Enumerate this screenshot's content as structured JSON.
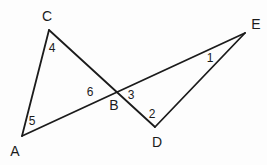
{
  "figure": {
    "background_color": "#fdfdfd",
    "line_color": "#1b1b1b",
    "width": 267,
    "height": 165
  },
  "chart_data": {
    "type": "diagram",
    "points": [
      {
        "name": "A",
        "x": 22,
        "y": 136
      },
      {
        "name": "B",
        "x": 116,
        "y": 91
      },
      {
        "name": "C",
        "x": 49,
        "y": 30
      },
      {
        "name": "D",
        "x": 155,
        "y": 127
      },
      {
        "name": "E",
        "x": 245,
        "y": 33
      }
    ],
    "segments": [
      {
        "from": "A",
        "to": "C"
      },
      {
        "from": "C",
        "to": "D"
      },
      {
        "from": "A",
        "to": "E"
      },
      {
        "from": "D",
        "to": "E"
      }
    ],
    "intersection": {
      "name": "B",
      "of": [
        "C-D",
        "A-E"
      ],
      "x": 116,
      "y": 91
    }
  },
  "vertices": [
    {
      "label": "C",
      "x": 47,
      "y": 16
    },
    {
      "label": "E",
      "x": 256,
      "y": 24
    },
    {
      "label": "B",
      "x": 114,
      "y": 105
    },
    {
      "label": "D",
      "x": 157,
      "y": 142
    },
    {
      "label": "A",
      "x": 15,
      "y": 151
    }
  ],
  "angles": [
    {
      "label": "4",
      "x": 52,
      "y": 48
    },
    {
      "label": "1",
      "x": 210,
      "y": 58
    },
    {
      "label": "6",
      "x": 90,
      "y": 92
    },
    {
      "label": "3",
      "x": 131,
      "y": 95
    },
    {
      "label": "2",
      "x": 152,
      "y": 114
    },
    {
      "label": "5",
      "x": 32,
      "y": 121
    }
  ]
}
